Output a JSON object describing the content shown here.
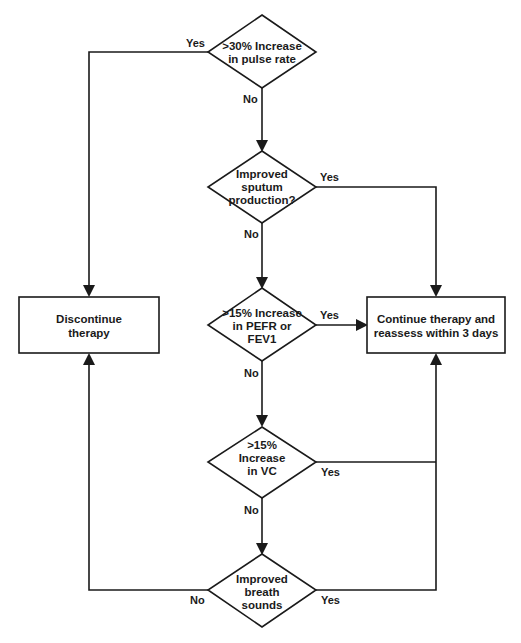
{
  "diagram": {
    "type": "flowchart",
    "nodes": {
      "d1": {
        "kind": "decision",
        "lines": [
          ">30% Increase",
          "in pulse rate"
        ]
      },
      "d2": {
        "kind": "decision",
        "lines": [
          "Improved",
          "sputum",
          "production?"
        ]
      },
      "d3": {
        "kind": "decision",
        "lines": [
          ">15% Increase",
          "in PEFR or",
          "FEV1"
        ]
      },
      "d4": {
        "kind": "decision",
        "lines": [
          ">15%",
          "Increase",
          "in VC"
        ]
      },
      "d5": {
        "kind": "decision",
        "lines": [
          "Improved",
          "breath",
          "sounds"
        ]
      },
      "discontinue": {
        "kind": "process",
        "lines": [
          "Discontinue",
          "therapy"
        ]
      },
      "continue": {
        "kind": "process",
        "lines": [
          "Continue therapy and",
          "reassess within 3 days"
        ]
      }
    },
    "edges": {
      "d1_yes": {
        "from": "d1",
        "to": "discontinue",
        "label": "Yes"
      },
      "d1_no": {
        "from": "d1",
        "to": "d2",
        "label": "No"
      },
      "d2_yes": {
        "from": "d2",
        "to": "continue",
        "label": "Yes"
      },
      "d2_no": {
        "from": "d2",
        "to": "d3",
        "label": "No"
      },
      "d3_yes": {
        "from": "d3",
        "to": "continue",
        "label": "Yes"
      },
      "d3_no": {
        "from": "d3",
        "to": "d4",
        "label": "No"
      },
      "d4_yes": {
        "from": "d4",
        "to": "continue",
        "label": "Yes"
      },
      "d4_no": {
        "from": "d4",
        "to": "d5",
        "label": "No"
      },
      "d5_yes": {
        "from": "d5",
        "to": "continue",
        "label": "Yes"
      },
      "d5_no": {
        "from": "d5",
        "to": "discontinue",
        "label": "No"
      }
    }
  }
}
